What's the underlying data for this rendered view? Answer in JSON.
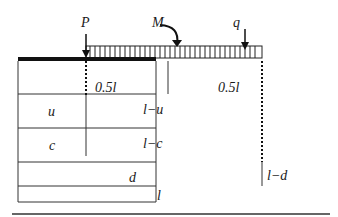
{
  "diagram": {
    "loads": {
      "point_load": "P",
      "moment": "M",
      "distributed_load": "q"
    },
    "rows": [
      {
        "left": "0.5l",
        "right": "0.5l"
      },
      {
        "left": "u",
        "right": "l−u"
      },
      {
        "left": "c",
        "right": "l−c"
      },
      {
        "left": "d",
        "right": "l−d"
      },
      {
        "full": "l"
      }
    ]
  }
}
